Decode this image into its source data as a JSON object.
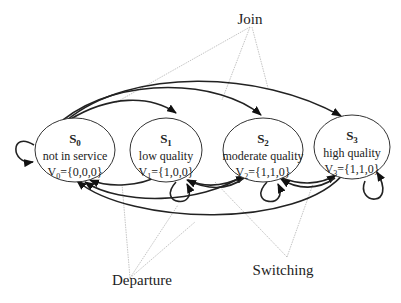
{
  "diagram": {
    "type": "state-transition",
    "states": [
      {
        "id": "S0",
        "name": "S",
        "sub": "0",
        "desc": "not in service",
        "vec_prefix": "V",
        "vec_sub": "0",
        "vec_value": "={0,0,0}"
      },
      {
        "id": "S1",
        "name": "S",
        "sub": "1",
        "desc": "low quality",
        "vec_prefix": "V",
        "vec_sub": "1",
        "vec_value": "={1,0,0}"
      },
      {
        "id": "S2",
        "name": "S",
        "sub": "2",
        "desc": "moderate quality",
        "vec_prefix": "V",
        "vec_sub": "2",
        "vec_value": "={1,1,0}"
      },
      {
        "id": "S3",
        "name": "S",
        "sub": "3",
        "desc": "high quality",
        "vec_prefix": "V",
        "vec_sub": "3",
        "vec_value": "={1,1,0}"
      }
    ],
    "annotations": {
      "join": "Join",
      "departure": "Departure",
      "switching": "Switching"
    },
    "transitions": {
      "join": [
        "S0->S1",
        "S0->S2",
        "S0->S3"
      ],
      "departure": [
        "S1->S0",
        "S2->S0",
        "S3->S0"
      ],
      "switching": [
        "S1<->S2",
        "S2<->S3"
      ],
      "self_loops": [
        "S0",
        "S1",
        "S2",
        "S3"
      ]
    }
  }
}
